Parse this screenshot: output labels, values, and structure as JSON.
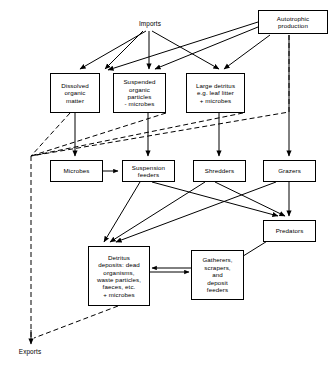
{
  "diagram": {
    "type": "flow-diagram",
    "nodes": {
      "autotrophic": "Autotrophic\nproduction",
      "dissolved_organic_matter": "Dissolved\norganic\nmatter",
      "suspended_organic_particles": "Suspended\norganic\nparticles\n- microbes",
      "large_detritus": "Large detritus\ne.g. leaf litter\n+ microbes",
      "microbes": "Microbes",
      "suspension_feeders": "Suspension\nfeeders",
      "shredders": "Shredders",
      "grazers": "Grazers",
      "predators": "Predators",
      "detritus_deposits": "Detritus\ndeposits: dead\norganisms,\nwaste particles,\nfaeces, etc.\n+ microbes",
      "gatherers": "Gatherers,\nscrapers,\nand\ndeposit\nfeeders"
    },
    "labels": {
      "imports": "Imports",
      "exports": "Exports"
    },
    "colors": {
      "stroke": "#000000",
      "background": "#ffffff"
    }
  }
}
